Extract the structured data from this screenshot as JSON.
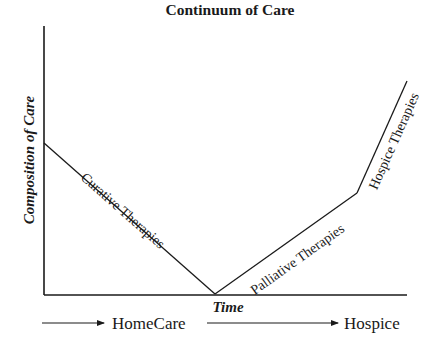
{
  "title": "Continuum of Care",
  "axes": {
    "y_label": "Composition of Care",
    "x_label": "Time"
  },
  "curves": [
    {
      "name": "curative",
      "label": "Curative Therapies",
      "points": [
        [
          44,
          143
        ],
        [
          215,
          294
        ]
      ]
    },
    {
      "name": "palliative",
      "label": "Palliative Therapies",
      "points": [
        [
          215,
          294
        ],
        [
          357,
          193
        ]
      ]
    },
    {
      "name": "hospice",
      "label": "Hospice Therapies",
      "points": [
        [
          357,
          193
        ],
        [
          407,
          81
        ]
      ]
    }
  ],
  "stages": [
    {
      "label": "HomeCare"
    },
    {
      "label": "Hospice"
    }
  ],
  "colors": {
    "ink": "#1a1a1a",
    "background": "#ffffff"
  }
}
